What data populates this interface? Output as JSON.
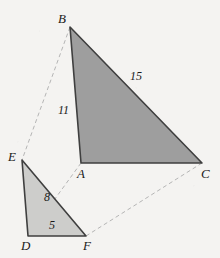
{
  "figure": {
    "background_color": "#f4f3f1",
    "stroke_color": "#3a3a3a",
    "dash_color": "#b5b5b5",
    "label_color": "#1a1a1a"
  },
  "triangles": [
    {
      "name": "triangle-abc",
      "fill_color": "#9e9e9e",
      "stroke_color": "#3f3f3f",
      "vertices": [
        {
          "label": "B",
          "x": 70,
          "y": 27
        },
        {
          "label": "A",
          "x": 81,
          "y": 163
        },
        {
          "label": "C",
          "x": 202,
          "y": 163
        }
      ]
    },
    {
      "name": "triangle-def",
      "fill_color": "#cdcdcb",
      "stroke_color": "#3f3f3f",
      "vertices": [
        {
          "label": "E",
          "x": 22,
          "y": 160
        },
        {
          "label": "D",
          "x": 28,
          "y": 236
        },
        {
          "label": "F",
          "x": 86,
          "y": 236
        }
      ]
    }
  ],
  "vertex_labels": [
    {
      "name": "vertex-label-b",
      "text": "B",
      "x": 58,
      "y": 12
    },
    {
      "name": "vertex-label-a",
      "text": "A",
      "x": 77,
      "y": 167
    },
    {
      "name": "vertex-label-c",
      "text": "C",
      "x": 201,
      "y": 167
    },
    {
      "name": "vertex-label-e",
      "text": "E",
      "x": 8,
      "y": 150
    },
    {
      "name": "vertex-label-d",
      "text": "D",
      "x": 21,
      "y": 239
    },
    {
      "name": "vertex-label-f",
      "text": "F",
      "x": 83,
      "y": 239
    }
  ],
  "side_labels": [
    {
      "name": "side-label-ab",
      "text": "11",
      "x": 58,
      "y": 104
    },
    {
      "name": "side-label-bc",
      "text": "15",
      "x": 130,
      "y": 70
    },
    {
      "name": "side-label-ef",
      "text": "8",
      "x": 44,
      "y": 191
    },
    {
      "name": "side-label-df",
      "text": "5",
      "x": 49,
      "y": 219
    }
  ],
  "correspondence_lines": [
    {
      "name": "dashed-line-b-e",
      "from": "B",
      "to": "E",
      "x1": 70,
      "y1": 27,
      "x2": 22,
      "y2": 160
    },
    {
      "name": "dashed-line-a-d",
      "from": "A",
      "to": "D",
      "x1": 81,
      "y1": 163,
      "x2": 28,
      "y2": 236
    },
    {
      "name": "dashed-line-c-f",
      "from": "C",
      "to": "F",
      "x1": 202,
      "y1": 163,
      "x2": 86,
      "y2": 236
    }
  ]
}
